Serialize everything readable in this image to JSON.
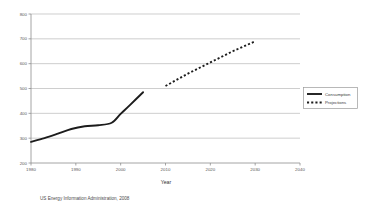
{
  "chart_data": {
    "type": "line",
    "title": "",
    "xlabel": "Year",
    "ylabel": "",
    "xlim": [
      1980,
      2040
    ],
    "ylim": [
      200,
      800
    ],
    "grid": true,
    "legend_position": "right-outside",
    "x_ticks": [
      "1980",
      "1990",
      "2000",
      "2010",
      "2020",
      "2030",
      "2040"
    ],
    "y_ticks": [
      "200",
      "300",
      "400",
      "500",
      "600",
      "700",
      "800"
    ],
    "source_note": "US Energy Information Administration, 2008",
    "series": [
      {
        "name": "Consumption",
        "style": "solid",
        "color": "#1c1c1c",
        "x": [
          1980,
          1983,
          1986,
          1989,
          1992,
          1995,
          1998,
          2000,
          2002,
          2005
        ],
        "values": [
          285,
          300,
          318,
          337,
          348,
          352,
          362,
          398,
          432,
          485
        ]
      },
      {
        "name": "Projections",
        "style": "dashed",
        "color": "#1c1c1c",
        "x": [
          2010,
          2015,
          2020,
          2025,
          2030
        ],
        "values": [
          510,
          560,
          605,
          650,
          690
        ]
      }
    ]
  },
  "legend": {
    "items": [
      {
        "label": "Consumption",
        "style": "solid"
      },
      {
        "label": "Projections",
        "style": "dashed"
      }
    ]
  }
}
